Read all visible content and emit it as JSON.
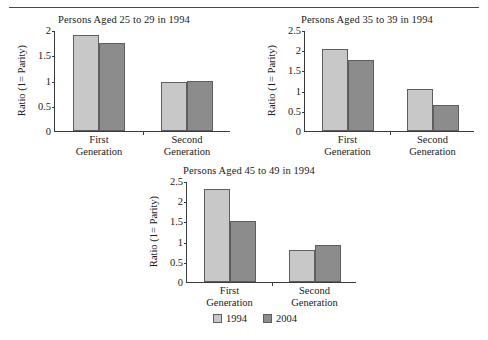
{
  "figure": {
    "ylabel": "Ratio (1= Parity)",
    "categories": [
      "First Generation",
      "Second Generation"
    ],
    "category_lines": [
      [
        "First",
        "Generation"
      ],
      [
        "Second",
        "Generation"
      ]
    ],
    "legend": {
      "position": "bottom-center",
      "entries": [
        {
          "label": "1994",
          "color": "#c8c8c8"
        },
        {
          "label": "2004",
          "color": "#8c8c8c"
        }
      ]
    },
    "colors": {
      "series_1994": "#c8c8c8",
      "series_2004": "#8c8c8c",
      "axis": "#3a3a3a",
      "bar_outline": "#5e5e5e",
      "rule": "#4a4a4a",
      "text": "#1a1a1a",
      "background": "#ffffff"
    }
  },
  "chart_data": [
    {
      "type": "bar",
      "title": "Persons Aged 25 to 29 in 1994",
      "xlabel": "",
      "ylabel": "Ratio (1= Parity)",
      "categories": [
        "First Generation",
        "Second Generation"
      ],
      "series": [
        {
          "name": "1994",
          "values": [
            1.9,
            0.97
          ]
        },
        {
          "name": "2004",
          "values": [
            1.75,
            1.0
          ]
        }
      ],
      "ylim": [
        0,
        2
      ],
      "yticks": [
        0,
        0.5,
        1,
        1.5,
        2
      ],
      "ytick_labels": [
        "0",
        "0.5",
        "1",
        "1.5",
        "2"
      ],
      "grid": false,
      "legend": [
        "1994",
        "2004"
      ]
    },
    {
      "type": "bar",
      "title": "Persons Aged 35 to 39 in 1994",
      "xlabel": "",
      "ylabel": "Ratio (1= Parity)",
      "categories": [
        "First Generation",
        "Second Generation"
      ],
      "series": [
        {
          "name": "1994",
          "values": [
            2.03,
            1.03
          ]
        },
        {
          "name": "2004",
          "values": [
            1.76,
            0.64
          ]
        }
      ],
      "ylim": [
        0,
        2.5
      ],
      "yticks": [
        0,
        0.5,
        1,
        1.5,
        2,
        2.5
      ],
      "ytick_labels": [
        "0",
        "0.5",
        "1",
        "1.5",
        "2",
        "2.5"
      ],
      "grid": false,
      "legend": [
        "1994",
        "2004"
      ]
    },
    {
      "type": "bar",
      "title": "Persons Aged 45 to 49 in 1994",
      "xlabel": "",
      "ylabel": "Ratio (1= Parity)",
      "categories": [
        "First Generation",
        "Second Generation"
      ],
      "series": [
        {
          "name": "1994",
          "values": [
            2.31,
            0.79
          ]
        },
        {
          "name": "2004",
          "values": [
            1.51,
            0.92
          ]
        }
      ],
      "ylim": [
        0,
        2.5
      ],
      "yticks": [
        0,
        0.5,
        1,
        1.5,
        2,
        2.5
      ],
      "ytick_labels": [
        "0",
        "0.5",
        "1",
        "1.5",
        "2",
        "2.5"
      ],
      "grid": false,
      "legend": [
        "1994",
        "2004"
      ]
    }
  ]
}
